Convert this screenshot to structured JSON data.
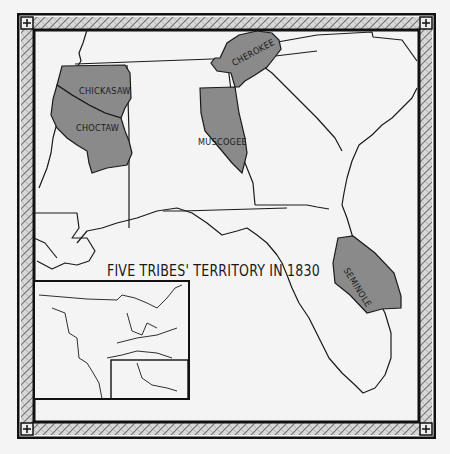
{
  "map": {
    "title": "FIVE TRIBES' TERRITORY IN 1830",
    "colors": {
      "territory_fill": "#8a8a8a",
      "outline": "#1a1a1a",
      "background": "#f4f4f4",
      "border_pattern": "#9a9a9a"
    },
    "territories": [
      {
        "id": "chickasaw",
        "label": "CHICKASAW"
      },
      {
        "id": "choctaw",
        "label": "CHOCTAW"
      },
      {
        "id": "cherokee",
        "label": "CHEROKEE"
      },
      {
        "id": "muscogee",
        "label": "MUSCOGEE"
      },
      {
        "id": "seminole",
        "label": "SEMINOLE"
      }
    ],
    "inset": {
      "description": "Inset map of eastern United States with highlighted southeast region"
    }
  }
}
